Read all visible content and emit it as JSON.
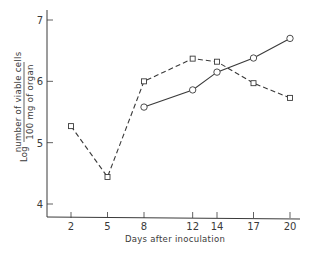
{
  "chart_data": {
    "type": "line",
    "title": "",
    "xlabel": "Days after inoculation",
    "ylabel": {
      "prefix": "Log",
      "numerator": "number of viable cells",
      "denominator": "100 mg of organ"
    },
    "xticks": [
      2,
      5,
      8,
      12,
      14,
      17,
      20
    ],
    "yticks": [
      4,
      5,
      6,
      7
    ],
    "xlim": [
      0,
      20.8
    ],
    "ylim": [
      3.8,
      7.2
    ],
    "grid": false,
    "legend": "none",
    "series": [
      {
        "name": "squares (dashed)",
        "marker": "square",
        "linestyle": "dashed",
        "x": [
          2,
          5,
          8,
          12,
          14,
          17,
          20
        ],
        "values": [
          5.27,
          4.44,
          6.0,
          6.37,
          6.32,
          5.97,
          5.73
        ]
      },
      {
        "name": "circles (solid)",
        "marker": "circle",
        "linestyle": "solid",
        "x": [
          8,
          12,
          14,
          17,
          20
        ],
        "values": [
          5.58,
          5.86,
          6.15,
          6.38,
          6.7
        ]
      }
    ]
  },
  "colors": {
    "ink": "#3a3a3a",
    "background": "#ffffff"
  }
}
